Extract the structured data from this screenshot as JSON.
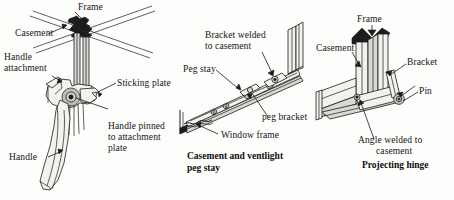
{
  "figure": {
    "background_color": "#fdfdfb",
    "ink_color": "#1b1b1b"
  },
  "diagrams": [
    {
      "id": "casement-handle",
      "caption": "",
      "labels": [
        {
          "key": "frame",
          "text": "Frame"
        },
        {
          "key": "casement",
          "text": "Casement"
        },
        {
          "key": "handle_attachment",
          "text": "Handle\nattachment"
        },
        {
          "key": "sticking_plate",
          "text": "Sticking plate"
        },
        {
          "key": "handle_pinned",
          "text": "Handle pinned\nto attachment\nplate"
        },
        {
          "key": "handle",
          "text": "Handle"
        }
      ]
    },
    {
      "id": "peg-stay",
      "caption": "Casement and ventlight\npeg stay",
      "labels": [
        {
          "key": "bracket_welded",
          "text": "Bracket welded\nto casement"
        },
        {
          "key": "peg_stay",
          "text": "Peg stay"
        },
        {
          "key": "peg_bracket",
          "text": "peg bracket"
        },
        {
          "key": "window_frame",
          "text": "Window frame"
        }
      ]
    },
    {
      "id": "projecting-hinge",
      "caption": "Projecting hinge",
      "labels": [
        {
          "key": "frame",
          "text": "Frame"
        },
        {
          "key": "casement",
          "text": "Casement"
        },
        {
          "key": "bracket",
          "text": "Bracket"
        },
        {
          "key": "pin",
          "text": "Pin"
        },
        {
          "key": "angle_welded",
          "text": "Angle welded to\ncasement"
        }
      ]
    }
  ],
  "captions": {
    "peg_stay_line1": "Casement and ventlight",
    "peg_stay_line2": "peg stay",
    "projecting_hinge": "Projecting hinge"
  },
  "label_text": {
    "d1_frame": "Frame",
    "d1_casement": "Casement",
    "d1_handle_attachment_1": "Handle",
    "d1_handle_attachment_2": "attachment",
    "d1_sticking_plate": "Sticking plate",
    "d1_handle_pinned_1": "Handle pinned",
    "d1_handle_pinned_2": "to attachment",
    "d1_handle_pinned_3": "plate",
    "d1_handle": "Handle",
    "d2_bracket_welded_1": "Bracket welded",
    "d2_bracket_welded_2": "to casement",
    "d2_peg_stay": "Peg stay",
    "d2_peg_bracket": "peg bracket",
    "d2_window_frame": "Window frame",
    "d3_frame": "Frame",
    "d3_casement": "Casement",
    "d3_bracket": "Bracket",
    "d3_pin": "Pin",
    "d3_angle_welded_1": "Angle welded to",
    "d3_angle_welded_2": "casement"
  }
}
